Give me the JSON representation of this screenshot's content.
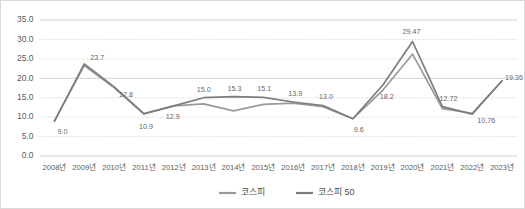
{
  "chart_data": {
    "type": "line",
    "title": "",
    "xlabel": "",
    "ylabel": "",
    "grid": true,
    "legend_position": "bottom-center",
    "ylim": [
      0.0,
      35.0
    ],
    "yticks": [
      "0.0",
      "5.0",
      "10.0",
      "15.0",
      "20.0",
      "25.0",
      "30.0",
      "35.0"
    ],
    "ytick_values": [
      0.0,
      5.0,
      10.0,
      15.0,
      20.0,
      25.0,
      30.0,
      35.0
    ],
    "categories": [
      "2008년",
      "2009년",
      "2010년",
      "2011년",
      "2012년",
      "2013년",
      "2014년",
      "2015년",
      "2016년",
      "2017년",
      "2018년",
      "2019년",
      "2020년",
      "2021년",
      "2022년",
      "2023년"
    ],
    "series": [
      {
        "name": "코스피",
        "color": "#9a9a9a",
        "values": [
          9.0,
          23.3,
          17.6,
          10.8,
          12.9,
          13.4,
          11.6,
          13.3,
          13.6,
          12.7,
          9.6,
          16.9,
          26.2,
          12.2,
          11.0,
          19.36
        ]
      },
      {
        "name": "코스피 50",
        "color": "#7d7d7d",
        "values": [
          9.0,
          23.7,
          17.8,
          10.9,
          12.9,
          15.0,
          15.3,
          15.1,
          13.9,
          13.0,
          9.6,
          18.2,
          29.47,
          12.72,
          10.76,
          19.36
        ]
      }
    ],
    "point_labels": [
      {
        "index": 0,
        "text": "9.0",
        "dx": 8,
        "dy": 13
      },
      {
        "index": 1,
        "text": "23.7",
        "dx": 13,
        "dy": -4
      },
      {
        "index": 2,
        "text": "17.8",
        "dx": 12,
        "dy": 10
      },
      {
        "index": 3,
        "text": "10.9",
        "dx": 2,
        "dy": 15
      },
      {
        "index": 4,
        "text": "12.9",
        "dx": -1,
        "dy": 13
      },
      {
        "index": 5,
        "text": "15.0",
        "dx": 0,
        "dy": -6
      },
      {
        "index": 6,
        "text": "15.3",
        "dx": 1,
        "dy": -6
      },
      {
        "index": 7,
        "text": "15.1",
        "dx": 1,
        "dy": -6
      },
      {
        "index": 8,
        "text": "13.9",
        "dx": 2,
        "dy": -6
      },
      {
        "index": 9,
        "text": "13.0",
        "dx": 3,
        "dy": -6
      },
      {
        "index": 10,
        "text": "9.6",
        "dx": 6,
        "dy": 13
      },
      {
        "index": 11,
        "text": "18.2",
        "dx": 4,
        "dy": 14
      },
      {
        "index": 12,
        "text": "29.47",
        "dx": -1,
        "dy": -7
      },
      {
        "index": 13,
        "text": "12.72",
        "dx": 6,
        "dy": -6
      },
      {
        "index": 14,
        "text": "10.76",
        "dx": 14,
        "dy": 9
      },
      {
        "index": 15,
        "text": "19.36",
        "dx": 12,
        "dy": -1
      }
    ]
  },
  "legend": {
    "items": [
      {
        "label": "코스피"
      },
      {
        "label": "코스피 50"
      }
    ]
  }
}
